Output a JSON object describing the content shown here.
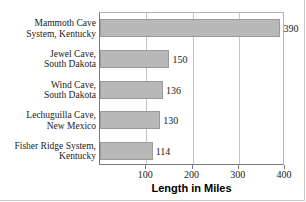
{
  "chart_data": {
    "type": "bar",
    "orientation": "horizontal",
    "title": "",
    "xlabel": "Length in Miles",
    "ylabel": "",
    "categories": [
      "Mammoth Cave System, Kentucky",
      "Jewel Cave, South Dakota",
      "Wind Cave, South Dakota",
      "Lechuguilla Cave, New Mexico",
      "Fisher Ridge System, Kentucky"
    ],
    "category_lines": [
      [
        "Mammoth Cave",
        "System, Kentucky"
      ],
      [
        "Jewel Cave,",
        "South Dakota"
      ],
      [
        "Wind Cave,",
        "South Dakota"
      ],
      [
        "Lechuguilla Cave,",
        "New Mexico"
      ],
      [
        "Fisher Ridge System,",
        "Kentucky"
      ]
    ],
    "values": [
      390,
      150,
      136,
      130,
      114
    ],
    "value_labels": [
      "390",
      "150",
      "136",
      "130",
      "114"
    ],
    "xlim": [
      0,
      400
    ],
    "xticks": [
      100,
      200,
      300,
      400
    ],
    "xtick_labels": [
      "100",
      "200",
      "300",
      "400"
    ],
    "grid": "vertical",
    "legend": "none",
    "bar_color": "#b8b8b8",
    "bar_border_color": "#9a9a9a",
    "axis_color": "#7a7a7a",
    "gridline_color": "#c4c4c4",
    "text_color": "#1a1a1a"
  }
}
